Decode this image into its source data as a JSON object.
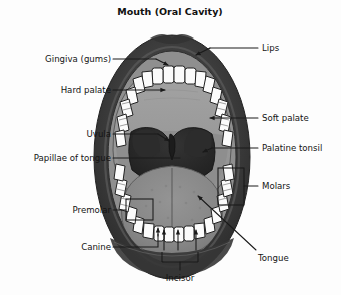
{
  "figure": {
    "title": "Mouth (Oral Cavity)",
    "width": 341,
    "height": 295,
    "background_color": "#fdfdfd"
  },
  "palette": {
    "lip_outer": "#3a3a3a",
    "lip_inner": "#4d4d4d",
    "gingiva": "#8f8f8f",
    "palate": "#9a9a9a",
    "soft_palate": "#8d8d8d",
    "throat_dark": "#2a2a2a",
    "tonsil": "#323232",
    "tongue": "#8a8a8a",
    "tooth": "#fbfbfb",
    "tooth_outline": "#222222",
    "line": "#1a1a1a",
    "text": "#141414"
  },
  "labels": [
    {
      "id": "lips",
      "text": "Lips",
      "side": "right",
      "text_x": 262,
      "text_y": 52,
      "marker": "arrow",
      "leader": "M 258 48 L 208 48 L 193 56",
      "arrow_at": [
        193,
        56
      ],
      "arrow_angle": 150
    },
    {
      "id": "gingiva",
      "text": "Gingiva (gums)",
      "side": "left",
      "text_x": 30,
      "text_y": 62,
      "marker": "arrow",
      "leader": "M 113 59 L 155 59 L 170 66",
      "arrow_at": [
        170,
        66
      ],
      "arrow_angle": 28
    },
    {
      "id": "hard-palate",
      "text": "Hard palate",
      "side": "left",
      "text_x": 44,
      "text_y": 93,
      "marker": "arrow",
      "leader": "M 113 90 L 168 90",
      "arrow_at": [
        172,
        90
      ],
      "arrow_angle": 0
    },
    {
      "id": "soft-palate",
      "text": "Soft palate",
      "side": "right",
      "text_x": 262,
      "text_y": 122,
      "marker": "arrow",
      "leader": "M 258 118 L 212 118",
      "arrow_at": [
        207,
        118
      ],
      "arrow_angle": 180
    },
    {
      "id": "uvula",
      "text": "Uvula",
      "side": "left",
      "text_x": 80,
      "text_y": 137,
      "marker": "arrow",
      "leader": "M 113 134 L 158 134 L 170 141",
      "arrow_at": [
        170,
        141
      ],
      "arrow_angle": 30
    },
    {
      "id": "palatine-tonsil",
      "text": "Palatine tonsil",
      "side": "right",
      "text_x": 262,
      "text_y": 152,
      "marker": "arrow",
      "leader": "M 258 148 L 212 148 L 203 152",
      "arrow_at": [
        203,
        152
      ],
      "arrow_angle": 156
    },
    {
      "id": "papillae-of-tongue",
      "text": "Papillae of tongue",
      "side": "left",
      "text_x": 14,
      "text_y": 161,
      "marker": "none",
      "leader": "M 113 158 L 178 158",
      "arrow_at": null,
      "arrow_angle": 0
    },
    {
      "id": "molars",
      "text": "Molars",
      "side": "right",
      "text_x": 262,
      "text_y": 190,
      "marker": "bracket-box",
      "leader": "M 258 186 L 244 186",
      "box": [
        218,
        168,
        26,
        37
      ],
      "arrow_at": null,
      "arrow_angle": 0
    },
    {
      "id": "premolar",
      "text": "Premolar",
      "side": "left",
      "text_x": 62,
      "text_y": 214,
      "marker": "bracket-box",
      "leader": "M 113 210 L 126 210",
      "box": [
        126,
        199,
        27,
        21
      ],
      "arrow_at": null,
      "arrow_angle": 0
    },
    {
      "id": "canine",
      "text": "Canine",
      "side": "left",
      "text_x": 74,
      "text_y": 250,
      "marker": "none",
      "leader": "M 113 247 L 158 247 L 158 233",
      "arrow_at": [
        158,
        228
      ],
      "arrow_angle": 270
    },
    {
      "id": "incisor",
      "text": "Incisor",
      "side": "bottom",
      "text_x": 167,
      "text_y": 281,
      "marker": "bracket-u",
      "leader": "M 180 272 L 180 262",
      "bracket_u": "M 162 262 L 162 254 M 162 262 L 198 262 M 198 262 L 198 254",
      "arrows": [
        {
          "at": [
            164,
            228
          ],
          "angle": 270
        },
        {
          "at": [
            178,
            228
          ],
          "angle": 270
        },
        {
          "at": [
            196,
            228
          ],
          "angle": 270
        }
      ]
    },
    {
      "id": "tongue",
      "text": "Tongue",
      "side": "right",
      "text_x": 258,
      "text_y": 258,
      "marker": "arrow",
      "leader": "M 256 252 L 196 195",
      "arrow_at": [
        193,
        192
      ],
      "arrow_angle": 223
    }
  ],
  "structures": [
    {
      "id": "lips",
      "name": "Lips",
      "color": "#3a3a3a"
    },
    {
      "id": "gingiva",
      "name": "Gingiva (gums)",
      "color": "#8f8f8f"
    },
    {
      "id": "hard-palate",
      "name": "Hard palate",
      "color": "#9a9a9a"
    },
    {
      "id": "soft-palate",
      "name": "Soft palate",
      "color": "#8d8d8d"
    },
    {
      "id": "uvula",
      "name": "Uvula",
      "color": "#2a2a2a"
    },
    {
      "id": "palatine-tonsil",
      "name": "Palatine tonsil",
      "color": "#323232"
    },
    {
      "id": "tongue",
      "name": "Tongue",
      "color": "#8a8a8a"
    },
    {
      "id": "teeth",
      "name": "Teeth",
      "color": "#fbfbfb"
    }
  ],
  "teeth": {
    "upper_count": 16,
    "lower_count": 16,
    "types": [
      "Incisor",
      "Canine",
      "Premolar",
      "Molars"
    ]
  }
}
